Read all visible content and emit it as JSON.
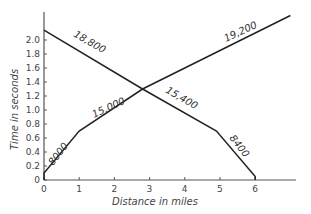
{
  "chart_data": {
    "type": "line",
    "title": "",
    "xlabel": "Distance in miles",
    "ylabel": "Time in seconds",
    "xlim": [
      0,
      7.0
    ],
    "ylim": [
      0,
      2.4
    ],
    "grid": false,
    "x_ticks": [
      "0",
      "1",
      "2",
      "3",
      "4",
      "5",
      "6"
    ],
    "y_ticks": [
      "0",
      "0.2",
      "0.4",
      "0.6",
      "0.8",
      "1.0",
      "1.2",
      "1.4",
      "1.6",
      "1.8",
      "2.0"
    ],
    "series": [
      {
        "name": "ascending",
        "points": [
          [
            0,
            0
          ],
          [
            0,
            0.1
          ],
          [
            1,
            0.7
          ],
          [
            2.8,
            1.3
          ],
          [
            7.0,
            2.35
          ]
        ],
        "segment_labels": [
          "8000",
          "15,000",
          "19,200"
        ]
      },
      {
        "name": "descending",
        "points": [
          [
            0,
            2.14
          ],
          [
            2.8,
            1.3
          ],
          [
            4.9,
            0.7
          ],
          [
            6,
            0.05
          ],
          [
            6,
            0
          ]
        ],
        "segment_labels": [
          "18,800",
          "15,400",
          "8400"
        ]
      }
    ]
  }
}
